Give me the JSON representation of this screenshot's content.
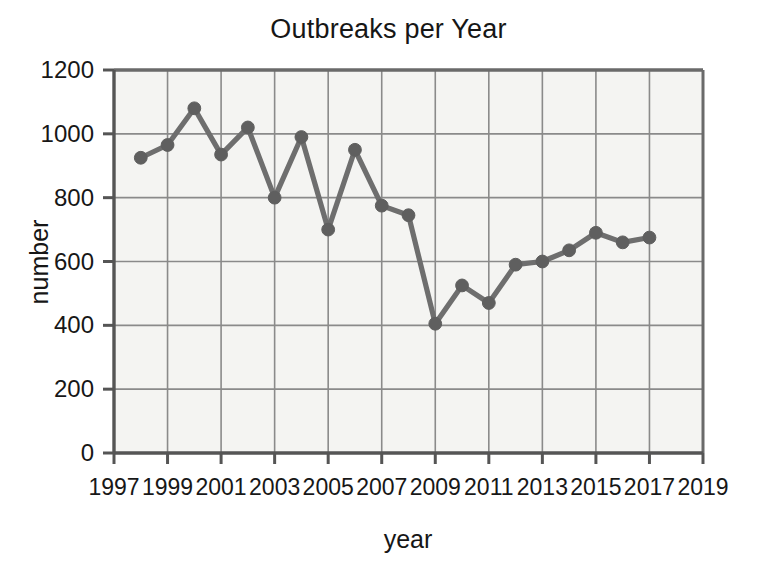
{
  "chart_data": {
    "type": "line",
    "title": "Outbreaks per Year",
    "xlabel": "year",
    "ylabel": "number",
    "x": [
      1998,
      1999,
      2000,
      2001,
      2002,
      2003,
      2004,
      2005,
      2006,
      2007,
      2008,
      2009,
      2010,
      2011,
      2012,
      2013,
      2014,
      2015,
      2016,
      2017
    ],
    "values": [
      925,
      965,
      1080,
      935,
      1020,
      800,
      990,
      700,
      950,
      775,
      745,
      405,
      525,
      470,
      590,
      600,
      635,
      690,
      660,
      675
    ],
    "series": [
      {
        "name": "outbreaks",
        "values": [
          925,
          965,
          1080,
          935,
          1020,
          800,
          990,
          700,
          950,
          775,
          745,
          405,
          525,
          470,
          590,
          600,
          635,
          690,
          660,
          675
        ]
      }
    ],
    "xlim": [
      1997,
      2019
    ],
    "ylim": [
      0,
      1200
    ],
    "xticks": [
      1997,
      1999,
      2001,
      2003,
      2005,
      2007,
      2009,
      2011,
      2013,
      2015,
      2017,
      2019
    ],
    "yticks": [
      0,
      200,
      400,
      600,
      800,
      1000,
      1200
    ],
    "xtick_labels": [
      "1997",
      "1999",
      "2001",
      "2003",
      "2005",
      "2007",
      "2009",
      "2011",
      "2013",
      "2015",
      "2017",
      "2019"
    ],
    "ytick_labels": [
      "0",
      "200",
      "400",
      "600",
      "800",
      "1000",
      "1200"
    ],
    "grid": true,
    "legend": "none",
    "marker": "circle",
    "colors": {
      "line": "#6e6e6e",
      "marker": "#5f5f5f",
      "grid": "#8a8a8a",
      "axis": "#6a6a6a",
      "plot_background": "#f4f4f2",
      "figure_background": "#ffffff",
      "text": "#171717"
    }
  }
}
